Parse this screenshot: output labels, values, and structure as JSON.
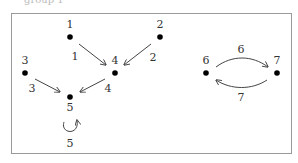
{
  "top_text": "group 1",
  "frame": {
    "x": 11,
    "y": 13,
    "width": 280,
    "height": 140,
    "stroke": "#9a9a9a"
  },
  "nodes": [
    {
      "id": "1",
      "label": "1",
      "x": 70,
      "y": 37,
      "lx": 70,
      "ly": 28
    },
    {
      "id": "2",
      "label": "2",
      "x": 160,
      "y": 37,
      "lx": 160,
      "ly": 28
    },
    {
      "id": "3",
      "label": "3",
      "x": 25,
      "y": 73,
      "lx": 25,
      "ly": 64
    },
    {
      "id": "4",
      "label": "4",
      "x": 115,
      "y": 73,
      "lx": 115,
      "ly": 64
    },
    {
      "id": "5",
      "label": "5",
      "x": 70,
      "y": 97,
      "lx": 70,
      "ly": 111
    },
    {
      "id": "6",
      "label": "6",
      "x": 206,
      "y": 73,
      "lx": 206,
      "ly": 64
    },
    {
      "id": "7",
      "label": "7",
      "x": 277,
      "y": 73,
      "lx": 277,
      "ly": 64
    }
  ],
  "edges": [
    {
      "from": "1",
      "to": "4",
      "label": "1",
      "path": "M79,44 L106,65",
      "lx": 75,
      "ly": 60
    },
    {
      "from": "2",
      "to": "4",
      "label": "2",
      "path": "M151,44 L124,65",
      "lx": 153,
      "ly": 61
    },
    {
      "from": "3",
      "to": "5",
      "label": "3",
      "path": "M35,79 L60,92",
      "lx": 32,
      "ly": 92
    },
    {
      "from": "4",
      "to": "5",
      "label": "4",
      "path": "M105,79 L80,92",
      "lx": 108,
      "ly": 92
    },
    {
      "from": "5",
      "to": "5",
      "label": "5",
      "path": "M64,122 C60,134 80,136 77,120",
      "lx": 70,
      "ly": 147
    },
    {
      "from": "6",
      "to": "7",
      "label": "6",
      "path": "M216,67 C232,55 252,55 268,67",
      "lx": 241,
      "ly": 53
    },
    {
      "from": "7",
      "to": "6",
      "label": "7",
      "path": "M267,80 C252,90 231,90 216,80",
      "lx": 241,
      "ly": 101
    }
  ],
  "colors": {
    "node": "#000000",
    "edge": "#444444",
    "text": "#333333"
  }
}
